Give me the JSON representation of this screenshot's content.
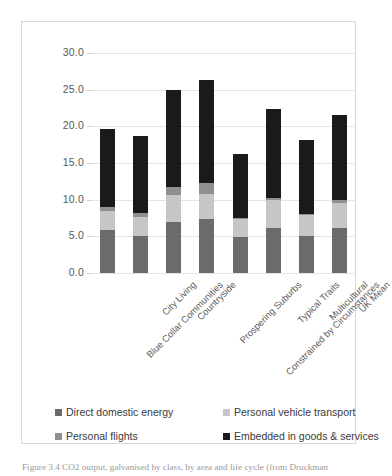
{
  "figure": {
    "caption": "Figure 3.4  CO2 output, galvanised by class, by area and life cycle (from Druckman"
  },
  "chart_data": {
    "type": "bar",
    "subtype": "stacked-bar",
    "title": "",
    "xlabel": "",
    "ylabel": "",
    "ylim": [
      0,
      30
    ],
    "yticks": [
      0,
      5,
      10,
      15,
      20,
      25,
      30
    ],
    "ytick_labels": [
      "0.0",
      "5.0",
      "10.0",
      "15.0",
      "20.0",
      "25.0",
      "30.0"
    ],
    "grid": true,
    "legend_position": "bottom",
    "categories": [
      "Blue Collar Communities",
      "City Living",
      "Countryside",
      "Prospering Suburbs",
      "Constrained by Circumstances",
      "Typical Traits",
      "Multicultural",
      "UK Mean"
    ],
    "series": [
      {
        "name": "Direct domestic energy",
        "color": "#6b6b6b",
        "values": [
          5.8,
          5.1,
          7.0,
          7.4,
          4.9,
          6.2,
          5.1,
          6.2
        ]
      },
      {
        "name": "Personal vehicle transport",
        "color": "#c6c6c6",
        "values": [
          2.7,
          2.6,
          3.6,
          3.4,
          2.4,
          3.7,
          2.8,
          3.4
        ]
      },
      {
        "name": "Personal flights",
        "color": "#8f8f8f",
        "values": [
          0.5,
          0.5,
          1.1,
          1.5,
          0.2,
          0.4,
          0.2,
          0.4
        ]
      },
      {
        "name": "Embedded in goods & services",
        "color": "#1a1a1a",
        "values": [
          10.6,
          10.5,
          13.3,
          14.0,
          8.7,
          12.1,
          10.1,
          11.6
        ]
      }
    ],
    "totals": [
      19.6,
      18.7,
      25.0,
      26.3,
      16.2,
      22.4,
      18.2,
      21.6
    ]
  },
  "legend": {
    "items": [
      {
        "label": "Direct domestic energy",
        "color": "#6b6b6b"
      },
      {
        "label": "Personal vehicle transport",
        "color": "#c6c6c6"
      },
      {
        "label": "Personal flights",
        "color": "#8f8f8f"
      },
      {
        "label": "Embedded in goods & services",
        "color": "#1a1a1a"
      }
    ]
  }
}
